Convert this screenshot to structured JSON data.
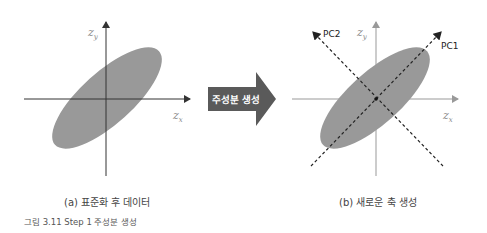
{
  "panel_a": {
    "caption": "(a) 표준화 후 데이터",
    "x_axis_label": "z",
    "x_axis_sub": "x",
    "y_axis_label": "z",
    "y_axis_sub": "y"
  },
  "transition": {
    "label": "주성분 생성",
    "color": "#5a5a5a"
  },
  "panel_b": {
    "caption": "(b) 새로운 축 생성",
    "x_axis_label": "z",
    "x_axis_sub": "x",
    "y_axis_label": "z",
    "y_axis_sub": "y",
    "pc1_label": "PC1",
    "pc2_label": "PC2"
  },
  "figure_caption": "그림 3.11 Step 1 주성분 생성",
  "colors": {
    "ellipse": "#999999",
    "axis_a": "#333333",
    "axis_b": "#999999",
    "pc_lines": "#222222"
  }
}
